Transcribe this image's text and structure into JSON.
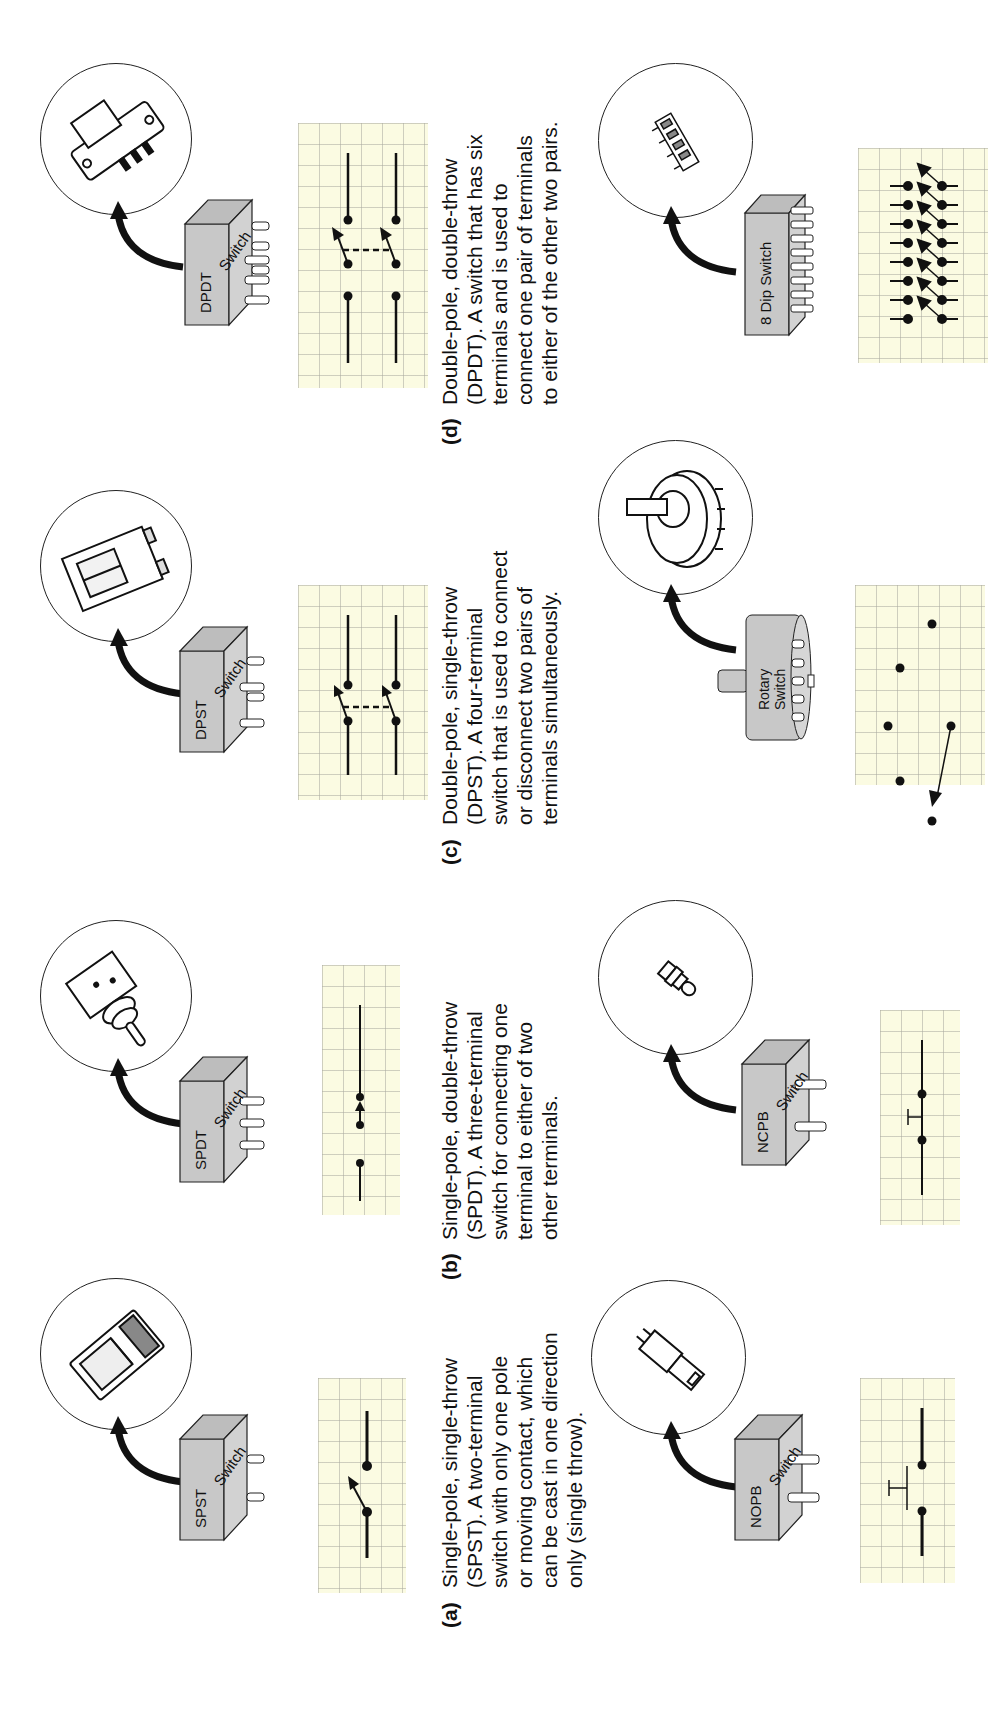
{
  "figure": {
    "panels": [
      {
        "id": "a",
        "tag": "(a)",
        "caption_lines": [
          "Single-pole, single-throw",
          "(SPST).  A two-terminal",
          "switch with only one pole",
          "or moving contact, which",
          "can be cast in one direction",
          "only (single throw)."
        ],
        "top_component": {
          "box_label": "SPST",
          "box_side": "Switch",
          "pins": 2
        },
        "bottom_component": {
          "box_label": "NOPB",
          "box_side": "Switch",
          "pins": 2
        }
      },
      {
        "id": "b",
        "tag": "(b)",
        "caption_lines": [
          "Single-pole, double-throw",
          "(SPDT).  A three-terminal",
          "switch for connecting one",
          "terminal to either of two",
          "other terminals."
        ],
        "top_component": {
          "box_label": "SPDT",
          "box_side": "Switch",
          "pins": 3
        },
        "bottom_component": {
          "box_label": "NCPB",
          "box_side": "Switch",
          "pins": 2
        }
      },
      {
        "id": "c",
        "tag": "(c)",
        "caption_lines": [
          "Double-pole, single-throw",
          "(DPST).  A four-terminal",
          "switch that is used to connect",
          "or disconnect two pairs of",
          "terminals simultaneously."
        ],
        "top_component": {
          "box_label": "DPST",
          "box_side": "Switch",
          "pins": 4
        },
        "bottom_component": {
          "box_label_line1": "Rotary",
          "box_label_line2": "Switch"
        }
      },
      {
        "id": "d",
        "tag": "(d)",
        "caption_lines": [
          "Double-pole, double-throw",
          "(DPDT).  A switch that has six",
          "terminals and is used to",
          "connect one pair of terminals",
          "to either of the other two pairs."
        ],
        "top_component": {
          "box_label": "DPDT",
          "box_side": "Switch",
          "pins": 6
        },
        "bottom_component": {
          "box_label": "8 Dip Switch",
          "pins": 16
        }
      }
    ],
    "colors": {
      "grid_background": "#fbfbe2",
      "grid_lines": "#b4b4a8",
      "component_box": "#c8c8c8",
      "ink": "#111111"
    }
  }
}
